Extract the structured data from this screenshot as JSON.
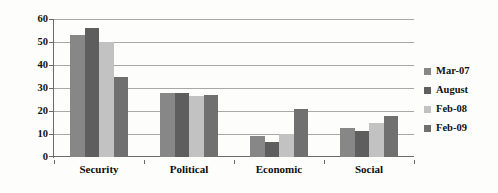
{
  "chart_data": {
    "type": "bar",
    "title": "",
    "subtitle": "",
    "xlabel": "",
    "ylabel": "",
    "ylim": [
      0,
      60
    ],
    "ytick_step": 10,
    "ytick_labels": [
      "0",
      "10",
      "20",
      "30",
      "40",
      "50",
      "60"
    ],
    "grid": true,
    "legend_position": "right",
    "categories": [
      "Security",
      "Political",
      "Economic",
      "Social"
    ],
    "series": [
      {
        "name": "Mar-07",
        "color": "#878787",
        "values": [
          53,
          28,
          9,
          12.5
        ]
      },
      {
        "name": "August",
        "color": "#5e5e5e",
        "values": [
          56,
          28,
          6.5,
          11.5
        ]
      },
      {
        "name": "Feb-08",
        "color": "#c2c2c2",
        "values": [
          50,
          26.5,
          10,
          15
        ]
      },
      {
        "name": "Feb-09",
        "color": "#707070",
        "values": [
          35,
          27,
          21,
          18
        ]
      }
    ]
  },
  "legend": {
    "items": [
      {
        "label": "Mar-07"
      },
      {
        "label": "August"
      },
      {
        "label": "Feb-08"
      },
      {
        "label": "Feb-09"
      }
    ]
  },
  "colors": {
    "background": "#fdfdfb",
    "gridline": "#a8a8a8",
    "axis": "#6a6a6a",
    "text": "#111111"
  }
}
